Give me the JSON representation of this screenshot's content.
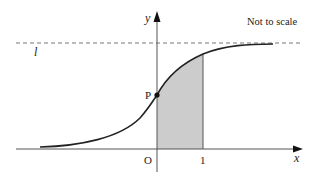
{
  "diagram": {
    "note": "Not to scale",
    "labels": {
      "y_axis": "y",
      "x_axis": "x",
      "origin": "O",
      "x_tick_1": "1",
      "point_p": "P",
      "asymptote": "l"
    },
    "colors": {
      "curve": "#222222",
      "axes": "#555555",
      "shade": "#cccccc",
      "dashed": "#777777"
    },
    "curve_description": "Increasing S-shaped curve approaching horizontal asymptote l from below, crossing y-axis at P",
    "shaded_region": "Area under curve between x = 0 and x = 1"
  }
}
